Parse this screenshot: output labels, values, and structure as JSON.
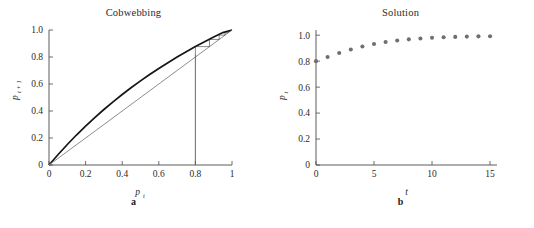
{
  "figure": {
    "background_color": "#ffffff",
    "panels": [
      {
        "id": "panel-a",
        "title": "Cobwebbing",
        "caption": "a",
        "xlabel_base": "p",
        "xlabel_sub": "t",
        "ylabel_base": "p",
        "ylabel_sub": "t + 1",
        "xticks": [
          "0",
          "0.2",
          "0.4",
          "0.6",
          "0.8",
          "1"
        ],
        "yticks": [
          "0",
          "0.2",
          "0.4",
          "0.6",
          "0.8",
          "1.0"
        ]
      },
      {
        "id": "panel-b",
        "title": "Solution",
        "caption": "b",
        "xlabel_base": "t",
        "xlabel_sub": "",
        "ylabel_base": "p",
        "ylabel_sub": "t",
        "xticks": [
          "0",
          "5",
          "10",
          "15"
        ],
        "yticks": [
          "0",
          "0.2",
          "0.4",
          "0.6",
          "0.8",
          "1.0"
        ]
      }
    ]
  },
  "chart_data": [
    {
      "type": "line",
      "id": "cobwebbing",
      "title": "Cobwebbing",
      "panel_label": "a",
      "xlabel": "p_t",
      "ylabel": "p_{t+1}",
      "xlim": [
        0,
        1
      ],
      "ylim": [
        0,
        1
      ],
      "xticks": [
        0,
        0.2,
        0.4,
        0.6,
        0.8,
        1
      ],
      "xticklabels": [
        "0",
        "0.2",
        "0.4",
        "0.6",
        "0.8",
        "1"
      ],
      "yticks": [
        0,
        0.2,
        0.4,
        0.6,
        0.8,
        1.0
      ],
      "yticklabels": [
        "0",
        "0.2",
        "0.4",
        "0.6",
        "0.8",
        "1.0"
      ],
      "grid": false,
      "legend": "none",
      "series": [
        {
          "name": "recurrence-map",
          "style": "solid-thick-black",
          "color": "#151515",
          "x": [
            0,
            0.05,
            0.1,
            0.15,
            0.2,
            0.25,
            0.3,
            0.35,
            0.4,
            0.45,
            0.5,
            0.55,
            0.6,
            0.65,
            0.7,
            0.75,
            0.8,
            0.85,
            0.9,
            0.95,
            1.0
          ],
          "y": [
            0,
            0.078,
            0.152,
            0.222,
            0.288,
            0.351,
            0.411,
            0.468,
            0.522,
            0.574,
            0.623,
            0.67,
            0.715,
            0.758,
            0.8,
            0.839,
            0.877,
            0.913,
            0.948,
            0.981,
            1.0
          ]
        },
        {
          "name": "identity-diagonal",
          "style": "solid-thin-gray",
          "color": "#8d8d8d",
          "x": [
            0,
            1
          ],
          "y": [
            0,
            1
          ]
        },
        {
          "name": "cobweb-staircase",
          "style": "solid-hairline",
          "color": "#2b2b2b",
          "start_p": 0.8,
          "vertices": [
            [
              0.8,
              0.0
            ],
            [
              0.8,
              0.877
            ],
            [
              0.877,
              0.877
            ],
            [
              0.877,
              0.93
            ],
            [
              0.93,
              0.93
            ],
            [
              0.93,
              0.962
            ],
            [
              0.962,
              0.962
            ],
            [
              0.962,
              0.979
            ],
            [
              0.979,
              0.979
            ],
            [
              0.979,
              0.989
            ],
            [
              0.989,
              0.989
            ],
            [
              0.989,
              0.994
            ],
            [
              0.994,
              0.994
            ],
            [
              0.994,
              0.997
            ],
            [
              0.997,
              0.997
            ],
            [
              0.997,
              0.999
            ],
            [
              0.999,
              0.999
            ],
            [
              1.0,
              1.0
            ]
          ]
        }
      ]
    },
    {
      "type": "scatter",
      "id": "solution",
      "title": "Solution",
      "panel_label": "b",
      "xlabel": "t",
      "ylabel": "p_t",
      "xlim": [
        0,
        15.6
      ],
      "ylim": [
        0,
        1.04
      ],
      "xticks": [
        0,
        5,
        10,
        15
      ],
      "xticklabels": [
        "0",
        "5",
        "10",
        "15"
      ],
      "yticks": [
        0,
        0.2,
        0.4,
        0.6,
        0.8,
        1.0
      ],
      "yticklabels": [
        "0",
        "0.2",
        "0.4",
        "0.6",
        "0.8",
        "1.0"
      ],
      "grid": false,
      "legend": "none",
      "marker": "filled-circle",
      "marker_color": "#6f6f6f",
      "x": [
        0,
        1,
        2,
        3,
        4,
        5,
        6,
        7,
        8,
        9,
        10,
        11,
        12,
        13,
        14,
        15
      ],
      "y": [
        0.8,
        0.832,
        0.863,
        0.89,
        0.913,
        0.932,
        0.947,
        0.959,
        0.968,
        0.975,
        0.98,
        0.984,
        0.987,
        0.989,
        0.991,
        0.992
      ]
    }
  ]
}
